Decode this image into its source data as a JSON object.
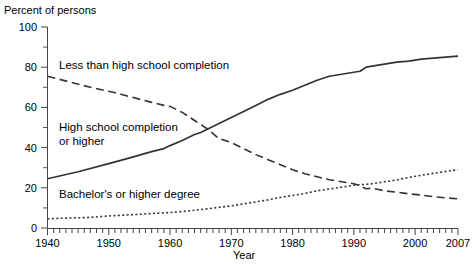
{
  "chart_data": {
    "type": "line",
    "title": "",
    "ylabel": "Percent of persons",
    "xlabel": "Year",
    "xlim": [
      1940,
      2007
    ],
    "ylim": [
      0,
      100
    ],
    "grid": false,
    "legend_position": "inline-annotations",
    "x_ticks_major": [
      1940,
      1950,
      1960,
      1970,
      1980,
      1990,
      2000,
      2007
    ],
    "x_tick_labels": [
      "1940",
      "1950",
      "1960",
      "1970",
      "1980",
      "1990",
      "2000",
      "2007"
    ],
    "x_tick_minor_step": 1,
    "y_ticks_major": [
      0,
      20,
      40,
      60,
      80,
      100
    ],
    "y_tick_labels": [
      "0",
      "20",
      "40",
      "60",
      "80",
      "100"
    ],
    "y_ticks_minor": [
      10,
      30,
      50,
      70,
      90
    ],
    "series": [
      {
        "name": "Less than high school completion",
        "style": "dashed",
        "color": "#333333",
        "label_x": 1942,
        "label_y": 80,
        "x": [
          1940,
          1947,
          1950,
          1952,
          1957,
          1959,
          1960,
          1962,
          1964,
          1965,
          1966,
          1967,
          1968,
          1970,
          1972,
          1974,
          1976,
          1978,
          1980,
          1982,
          1984,
          1986,
          1988,
          1990,
          1991,
          1992,
          1993,
          1994,
          1995,
          1997,
          1999,
          2001,
          2003,
          2005,
          2007
        ],
        "y": [
          75.5,
          70.0,
          68.0,
          66.5,
          62.5,
          61.0,
          60.5,
          57.5,
          53.5,
          51.5,
          49.5,
          47.0,
          44.5,
          42.5,
          39.5,
          36.5,
          34.0,
          31.5,
          29.0,
          27.0,
          25.5,
          24.0,
          23.0,
          22.0,
          21.0,
          19.5,
          19.8,
          19.2,
          18.5,
          17.8,
          17.0,
          16.4,
          15.6,
          15.0,
          14.5
        ]
      },
      {
        "name": "High school completion or higher",
        "style": "solid",
        "color": "#333333",
        "label_x": 1942,
        "label_y": 51,
        "x": [
          1940,
          1945,
          1950,
          1953,
          1957,
          1959,
          1960,
          1962,
          1964,
          1965,
          1966,
          1968,
          1970,
          1972,
          1974,
          1976,
          1978,
          1980,
          1982,
          1984,
          1986,
          1988,
          1990,
          1991,
          1992,
          1993,
          1995,
          1997,
          1999,
          2001,
          2003,
          2005,
          2007
        ],
        "y": [
          24.5,
          28.0,
          32.0,
          34.5,
          38.0,
          39.5,
          41.0,
          43.5,
          46.5,
          47.5,
          49.0,
          52.0,
          55.0,
          58.0,
          61.0,
          64.0,
          66.5,
          68.5,
          71.0,
          73.5,
          75.5,
          76.5,
          77.5,
          78.0,
          80.0,
          80.5,
          81.5,
          82.5,
          83.0,
          84.0,
          84.5,
          85.0,
          85.5
        ]
      },
      {
        "name": "Bachelor's or higher degree",
        "style": "dotted",
        "color": "#333333",
        "label_x": 1942,
        "label_y": 24,
        "x": [
          1940,
          1947,
          1950,
          1955,
          1960,
          1962,
          1964,
          1966,
          1968,
          1970,
          1972,
          1974,
          1976,
          1978,
          1980,
          1982,
          1984,
          1986,
          1988,
          1990,
          1991,
          1993,
          1995,
          1997,
          1999,
          2001,
          2003,
          2005,
          2007
        ],
        "y": [
          4.6,
          5.3,
          6.0,
          6.8,
          7.7,
          8.2,
          8.8,
          9.5,
          10.3,
          11.0,
          12.0,
          13.0,
          14.0,
          15.2,
          16.2,
          17.2,
          18.5,
          19.4,
          20.3,
          21.3,
          21.5,
          22.0,
          23.0,
          23.9,
          25.2,
          26.2,
          27.2,
          28.1,
          29.0
        ]
      }
    ]
  },
  "annotations": {
    "less_label": "Less than high school completion",
    "hs_label": "High school completion\nor higher",
    "bachelor_label": "Bachelor's or higher degree"
  }
}
